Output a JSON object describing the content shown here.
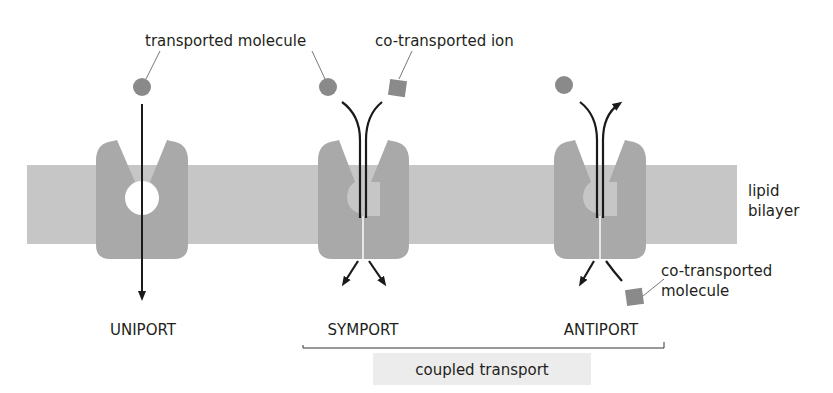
{
  "diagram": {
    "colors": {
      "background": "#ffffff",
      "membrane": "#c6c6c6",
      "transporter": "#a9a9a9",
      "molecule": "#8a8a8a",
      "arrow": "#1a1a1a",
      "text": "#231f20",
      "coupled_box": "#ececec"
    },
    "labels": {
      "transported_molecule": "transported molecule",
      "co_transported_ion": "co-transported ion",
      "lipid_bilayer_line1": "lipid",
      "lipid_bilayer_line2": "bilayer",
      "co_transported_molecule_line1": "co-transported",
      "co_transported_molecule_line2": "molecule",
      "coupled_transport": "coupled transport"
    },
    "transporters": [
      {
        "name": "UNIPORT",
        "label": "UNIPORT",
        "molecules": [
          "transported molecule"
        ],
        "direction": "single molecule crosses membrane"
      },
      {
        "name": "SYMPORT",
        "label": "SYMPORT",
        "molecules": [
          "transported molecule",
          "co-transported ion"
        ],
        "direction": "both in same direction"
      },
      {
        "name": "ANTIPORT",
        "label": "ANTIPORT",
        "molecules": [
          "transported molecule",
          "co-transported molecule"
        ],
        "direction": "opposite directions"
      }
    ],
    "grouping": {
      "bracket_spans": [
        "SYMPORT",
        "ANTIPORT"
      ],
      "group_label": "coupled transport"
    }
  }
}
